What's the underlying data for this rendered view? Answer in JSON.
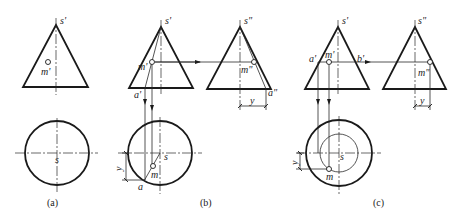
{
  "figure": {
    "panels": [
      {
        "caption": "(a)",
        "labels": {
          "apex_front": "s'",
          "point_front": "m'",
          "apex_plan": "s"
        }
      },
      {
        "caption": "(b)",
        "labels": {
          "apex_front": "s'",
          "point_front": "m'",
          "base_front": "a'",
          "apex_side": "s\"",
          "point_side": "m\"",
          "base_side": "a\"",
          "apex_plan": "s",
          "point_plan": "m",
          "base_plan": "a",
          "dim_side": "y",
          "dim_plan": "y"
        }
      },
      {
        "caption": "(c)",
        "labels": {
          "apex_front": "s'",
          "left_front": "a'",
          "point_front": "m'",
          "right_front": "b'",
          "apex_side": "s\"",
          "point_side": "m\"",
          "apex_plan": "s",
          "point_plan": "m",
          "dim_side": "y",
          "dim_plan": "y"
        }
      }
    ]
  }
}
